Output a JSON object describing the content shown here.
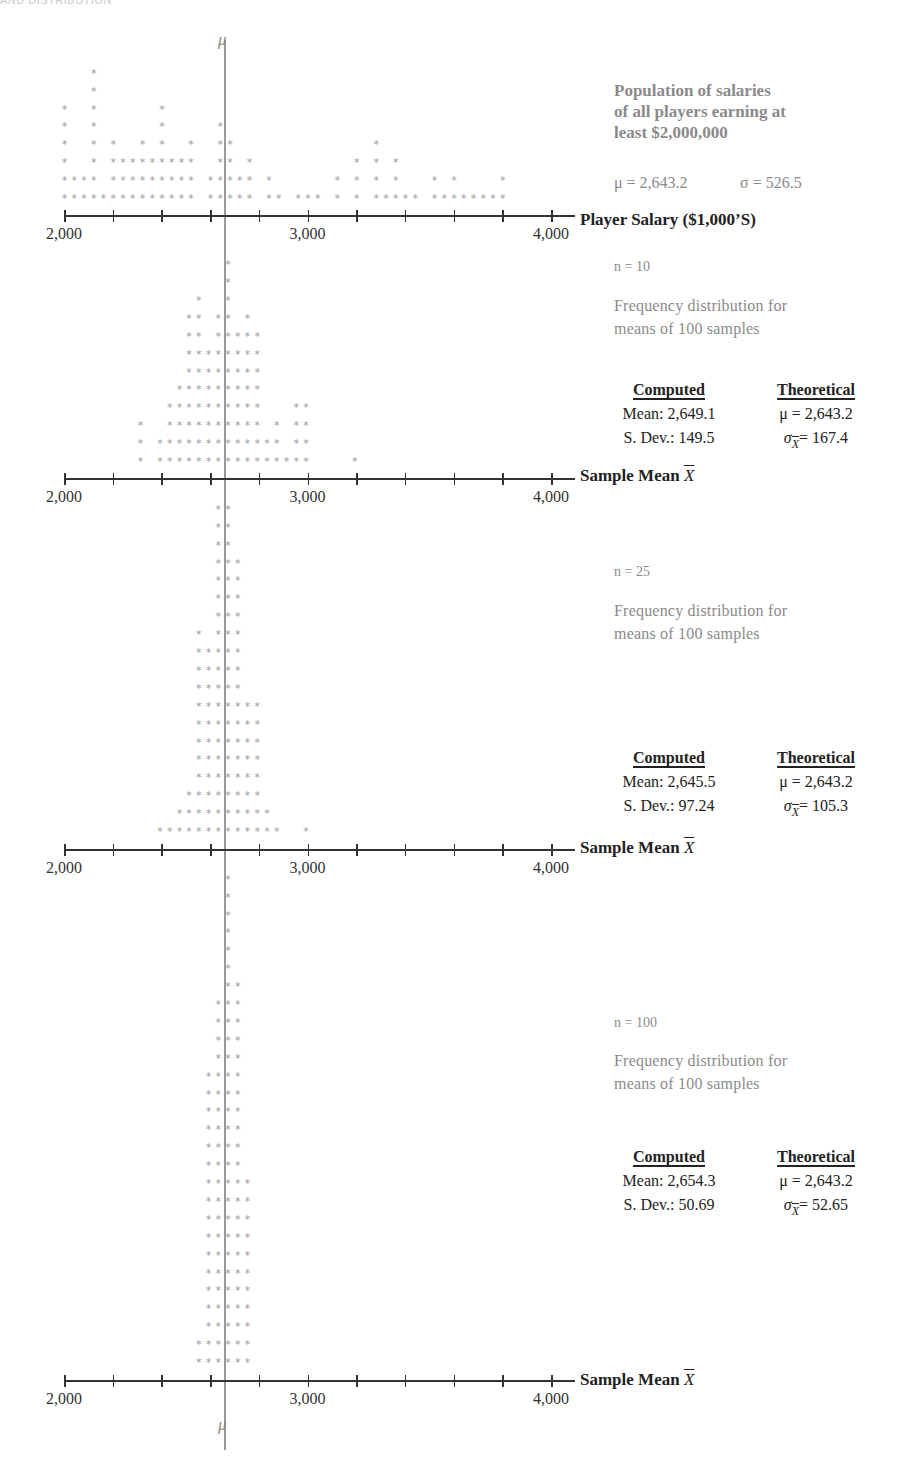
{
  "header": {
    "text": "AND DISTRIBUTION"
  },
  "axis": {
    "min": 2000,
    "max": 4000,
    "tick_step": 200,
    "tick_labels": [
      "2,000",
      "3,000",
      "4,000"
    ],
    "mu_symbol": "μ"
  },
  "population": {
    "title_lines": [
      "Population of salaries",
      "of all players earning at",
      "least $2,000,000"
    ],
    "mu_text": "μ = 2,643.2",
    "sigma_text": "σ = 526.5",
    "axis_title": "Player Salary ($1,000’S)"
  },
  "panels": [
    {
      "n_label": "n = 10",
      "desc_lines": [
        "Frequency distribution for",
        "means of 100 samples"
      ],
      "computed_header": "Computed",
      "theoretical_header": "Theoretical",
      "computed_mean": "Mean: 2,649.1",
      "computed_sd": "S. Dev.: 149.5",
      "theoretical_mu": "μ = 2,643.2",
      "theoretical_sigma": "= 167.4",
      "axis_title": "Sample Mean",
      "axis_symbol": "X"
    },
    {
      "n_label": "n = 25",
      "desc_lines": [
        "Frequency distribution for",
        "means of 100 samples"
      ],
      "computed_header": "Computed",
      "theoretical_header": "Theoretical",
      "computed_mean": "Mean: 2,645.5",
      "computed_sd": "S. Dev.: 97.24",
      "theoretical_mu": "μ = 2,643.2",
      "theoretical_sigma": "= 105.3",
      "axis_title": "Sample Mean",
      "axis_symbol": "X"
    },
    {
      "n_label": "n = 100",
      "desc_lines": [
        "Frequency distribution for",
        "means of 100 samples"
      ],
      "computed_header": "Computed",
      "theoretical_header": "Theoretical",
      "computed_mean": "Mean: 2,654.3",
      "computed_sd": "S. Dev.: 50.69",
      "theoretical_mu": "μ = 2,643.2",
      "theoretical_sigma": "= 52.65",
      "axis_title": "Sample Mean",
      "axis_symbol": "X"
    }
  ],
  "chart_data": [
    {
      "type": "scatter",
      "subtype": "dot-plot",
      "title": "Population of salaries of all players earning at least $2,000,000",
      "xlabel": "Player Salary ($1,000'S)",
      "xlim": [
        2000,
        4000
      ],
      "reference_line": {
        "label": "μ",
        "value": 2643.2
      },
      "stats": {
        "mu": 2643.2,
        "sigma": 526.5
      },
      "bin_width": 40,
      "rows_bottom_up": [
        [
          0,
          1,
          2,
          3,
          4,
          5,
          6,
          7,
          8,
          9,
          10,
          11,
          12,
          13,
          15,
          16,
          17,
          18,
          19,
          21,
          22,
          24,
          25,
          26,
          28,
          30,
          32,
          33,
          34,
          35,
          36,
          38,
          39,
          40,
          41,
          42,
          43,
          44,
          45
        ],
        [
          0,
          1,
          2,
          3,
          5,
          6,
          7,
          8,
          9,
          10,
          11,
          12,
          13,
          15,
          16,
          17,
          18,
          19,
          21,
          28,
          30,
          32,
          34,
          38,
          40,
          45
        ],
        [
          0,
          3,
          5,
          6,
          7,
          8,
          9,
          10,
          11,
          12,
          13,
          16,
          17,
          19,
          30,
          32,
          34
        ],
        [
          0,
          3,
          5,
          8,
          10,
          13,
          16,
          17,
          32
        ],
        [
          0,
          3,
          10,
          16
        ],
        [
          0,
          3,
          10
        ],
        [
          3
        ],
        [
          3
        ]
      ]
    },
    {
      "type": "scatter",
      "subtype": "dot-plot",
      "title": "n = 10: Frequency distribution for means of 100 samples",
      "xlabel": "Sample Mean X̄",
      "xlim": [
        2000,
        4000
      ],
      "computed": {
        "mean": 2649.1,
        "sd": 149.5
      },
      "theoretical": {
        "mu": 2643.2,
        "sigma_xbar": 167.4
      },
      "bin_width": 40,
      "rows_bottom_up": [
        [
          8,
          10,
          11,
          12,
          13,
          14,
          15,
          16,
          17,
          18,
          19,
          20,
          21,
          22,
          23,
          24,
          25,
          30
        ],
        [
          8,
          10,
          11,
          12,
          13,
          14,
          15,
          16,
          17,
          18,
          19,
          20,
          21,
          22,
          24,
          25
        ],
        [
          8,
          11,
          12,
          13,
          14,
          15,
          16,
          17,
          18,
          19,
          20,
          22,
          24,
          25
        ],
        [
          11,
          12,
          13,
          14,
          15,
          16,
          17,
          18,
          19,
          20,
          24,
          25
        ],
        [
          12,
          13,
          14,
          15,
          16,
          17,
          18,
          19,
          20
        ],
        [
          13,
          14,
          15,
          16,
          17,
          18,
          19,
          20
        ],
        [
          13,
          14,
          15,
          16,
          17,
          18,
          19,
          20
        ],
        [
          13,
          14,
          16,
          17,
          18,
          19,
          20
        ],
        [
          13,
          14,
          16,
          17,
          19
        ],
        [
          14,
          17
        ],
        [
          17
        ],
        [
          17
        ]
      ]
    },
    {
      "type": "scatter",
      "subtype": "dot-plot",
      "title": "n = 25: Frequency distribution for means of 100 samples",
      "xlabel": "Sample Mean X̄",
      "xlim": [
        2000,
        4000
      ],
      "computed": {
        "mean": 2645.5,
        "sd": 97.24
      },
      "theoretical": {
        "mu": 2643.2,
        "sigma_xbar": 105.3
      },
      "bin_width": 40,
      "rows_bottom_up": [
        [
          10,
          11,
          12,
          13,
          14,
          15,
          16,
          17,
          18,
          19,
          20,
          21,
          22,
          25
        ],
        [
          12,
          13,
          14,
          15,
          16,
          17,
          18,
          19,
          20,
          21
        ],
        [
          13,
          14,
          15,
          16,
          17,
          18,
          19,
          20
        ],
        [
          14,
          15,
          16,
          17,
          18,
          19,
          20
        ],
        [
          14,
          15,
          16,
          17,
          18,
          19,
          20
        ],
        [
          14,
          15,
          16,
          17,
          18,
          19,
          20
        ],
        [
          14,
          15,
          16,
          17,
          18,
          19,
          20
        ],
        [
          14,
          15,
          16,
          17,
          18,
          19,
          20
        ],
        [
          14,
          15,
          16,
          17,
          18
        ],
        [
          14,
          15,
          16,
          17,
          18
        ],
        [
          14,
          15,
          16,
          17,
          18
        ],
        [
          14,
          16,
          17,
          18
        ],
        [
          16,
          17,
          18
        ],
        [
          16,
          17,
          18
        ],
        [
          16,
          17,
          18
        ],
        [
          16,
          17,
          18
        ],
        [
          16,
          17
        ],
        [
          16,
          17
        ],
        [
          16,
          17
        ]
      ]
    },
    {
      "type": "scatter",
      "subtype": "dot-plot",
      "title": "n = 100: Frequency distribution for means of 100 samples",
      "xlabel": "Sample Mean X̄",
      "xlim": [
        2000,
        4000
      ],
      "computed": {
        "mean": 2654.3,
        "sd": 50.69
      },
      "theoretical": {
        "mu": 2643.2,
        "sigma_xbar": 52.65
      },
      "bin_width": 40,
      "rows_bottom_up": [
        [
          14,
          15,
          16,
          17,
          18,
          19
        ],
        [
          14,
          15,
          16,
          17,
          18,
          19
        ],
        [
          15,
          16,
          17,
          18,
          19
        ],
        [
          15,
          16,
          17,
          18,
          19
        ],
        [
          15,
          16,
          17,
          18,
          19
        ],
        [
          15,
          16,
          17,
          18,
          19
        ],
        [
          15,
          16,
          17,
          18,
          19
        ],
        [
          15,
          16,
          17,
          18,
          19
        ],
        [
          15,
          16,
          17,
          18,
          19
        ],
        [
          15,
          16,
          17,
          18,
          19
        ],
        [
          15,
          16,
          17,
          18,
          19
        ],
        [
          15,
          16,
          17,
          18
        ],
        [
          15,
          16,
          17,
          18
        ],
        [
          15,
          16,
          17,
          18
        ],
        [
          15,
          16,
          17,
          18
        ],
        [
          15,
          16,
          17,
          18
        ],
        [
          15,
          16,
          17,
          18
        ],
        [
          16,
          17,
          18
        ],
        [
          16,
          17,
          18
        ],
        [
          16,
          17,
          18
        ],
        [
          16,
          17,
          18
        ],
        [
          17,
          18
        ],
        [
          17
        ],
        [
          17
        ],
        [
          17
        ],
        [
          17
        ],
        [
          17
        ],
        [
          17
        ]
      ]
    }
  ]
}
